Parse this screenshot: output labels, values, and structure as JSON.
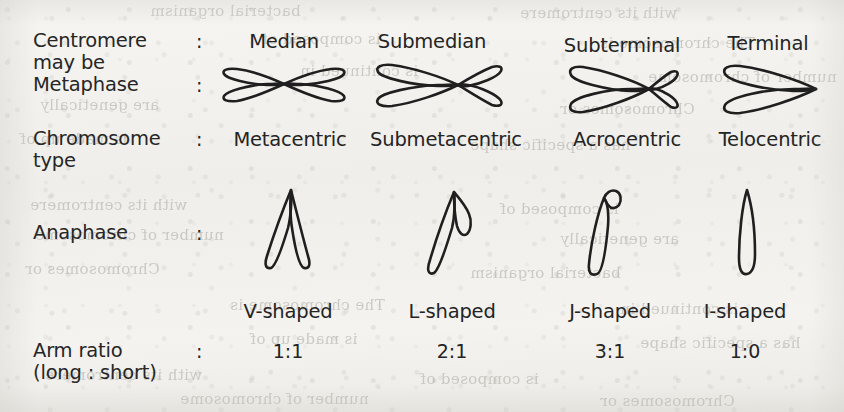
{
  "figure": {
    "type": "comparison-table",
    "row_labels": [
      {
        "id": "centromere",
        "line1": "Centromere",
        "line2": "may be",
        "colon": ":"
      },
      {
        "id": "metaphase",
        "line1": "Metaphase",
        "line2": "",
        "colon": ":"
      },
      {
        "id": "chromosome-type",
        "line1": "Chromosome",
        "line2": "type",
        "colon": ":"
      },
      {
        "id": "anaphase",
        "line1": "Anaphase",
        "line2": "",
        "colon": ":"
      },
      {
        "id": "arm-ratio",
        "line1": "Arm ratio",
        "line2": "(long : short)",
        "colon": ":"
      }
    ],
    "columns": [
      {
        "centromere_position": "Median",
        "chromosome_type": "Metacentric",
        "anaphase_shape": "V-shaped",
        "arm_ratio": "1:1",
        "metaphase_icon": "metacentric-chromosome-icon",
        "anaphase_icon": "v-shaped-chromosome-icon"
      },
      {
        "centromere_position": "Submedian",
        "chromosome_type": "Submetacentric",
        "anaphase_shape": "L-shaped",
        "arm_ratio": "2:1",
        "metaphase_icon": "submetacentric-chromosome-icon",
        "anaphase_icon": "l-shaped-chromosome-icon"
      },
      {
        "centromere_position": "Subterminal",
        "chromosome_type": "Acrocentric",
        "anaphase_shape": "J-shaped",
        "arm_ratio": "3:1",
        "metaphase_icon": "acrocentric-chromosome-icon",
        "anaphase_icon": "j-shaped-chromosome-icon"
      },
      {
        "centromere_position": "Terminal",
        "chromosome_type": "Telocentric",
        "anaphase_shape": "I-shaped",
        "arm_ratio": "1:0",
        "metaphase_icon": "telocentric-chromosome-icon",
        "anaphase_icon": "i-shaped-chromosome-icon"
      }
    ],
    "colors": {
      "paper": "#f3f2ef",
      "ink": "#242424",
      "bleed_through": "#a9a69d"
    }
  },
  "bleed_through_text": [
    "bacterial organism",
    "with its centromere",
    "is composed of",
    "The chromosome is",
    "is continued in",
    "number of chromosome",
    "are genetically",
    "Chromosomes or",
    "is made up of",
    "has a specific shape"
  ]
}
